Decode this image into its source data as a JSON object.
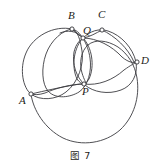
{
  "figure": {
    "caption": "图 7",
    "width": 161,
    "height": 167,
    "stroke_color": "#3b3b3f",
    "background_color": "#ffffff",
    "label_color": "#1d1d20"
  },
  "labels": {
    "A": "A",
    "B": "B",
    "C": "C",
    "D": "D",
    "P": "P",
    "Q": "Q"
  },
  "diagram_data": {
    "type": "geometry-circles",
    "description": "Four intersecting circles with labelled intersection points A, B, C, D, P, Q",
    "points": [
      {
        "name": "A",
        "x": 31,
        "y": 94,
        "label_dx": -10,
        "label_dy": 4
      },
      {
        "name": "B",
        "x": 72,
        "y": 29,
        "label_dx": -3,
        "label_dy": -17
      },
      {
        "name": "C",
        "x": 102,
        "y": 30,
        "label_dx": -2,
        "label_dy": -18
      },
      {
        "name": "D",
        "x": 137,
        "y": 62,
        "label_dx": 5,
        "label_dy": -5
      },
      {
        "name": "P",
        "x": 84,
        "y": 84,
        "label_dx": -1,
        "label_dy": 4
      },
      {
        "name": "Q",
        "x": 83,
        "y": 38,
        "label_dx": 1,
        "label_dy": -12
      }
    ],
    "circles": [
      {
        "name": "circle-ABQP-left-large",
        "cx": 55,
        "cy": 62,
        "r": 34
      },
      {
        "name": "circle-through-A-B-P",
        "cx": 66,
        "cy": 61,
        "r": 34
      },
      {
        "name": "circle-through-Q-C-D-P",
        "cx": 104,
        "cy": 60,
        "r": 33
      },
      {
        "name": "circle-through-A-P-D-bottom-large",
        "cx": 84,
        "cy": 83,
        "r": 53
      },
      {
        "name": "circle-small-lens-Q-P",
        "cx": 78,
        "cy": 61,
        "r": 23
      }
    ],
    "arcs": [
      {
        "from": "B",
        "to": "C",
        "note": "near-horizontal upper chord arcs meeting at Q"
      },
      {
        "from": "Q",
        "to": "P",
        "note": "lens/vesica formed by two arcs"
      }
    ]
  }
}
